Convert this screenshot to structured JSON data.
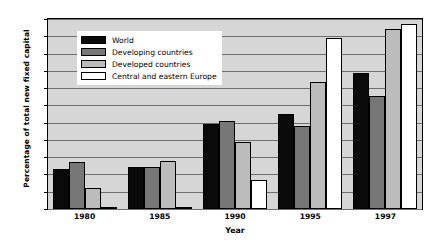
{
  "chart_data": {
    "type": "bar",
    "title": "",
    "xlabel": "Year",
    "ylabel": "Percentage of total new fixed capital",
    "categories": [
      "1980",
      "1985",
      "1990",
      "1995",
      "1997"
    ],
    "ylim": [
      0,
      11
    ],
    "yticks": [
      0,
      1,
      2,
      3,
      4,
      5,
      6,
      7,
      8,
      9,
      10,
      11
    ],
    "grid": true,
    "legend_position": "top-left-inside",
    "series": [
      {
        "name": "World",
        "color": "#0a0a0a",
        "values": [
          2.3,
          2.45,
          4.9,
          5.5,
          7.85
        ]
      },
      {
        "name": "Developing countries",
        "color": "#777777",
        "values": [
          2.75,
          2.45,
          5.1,
          4.8,
          6.55
        ]
      },
      {
        "name": "Developed countries",
        "color": "#bcbcbc",
        "values": [
          1.2,
          2.8,
          3.9,
          7.35,
          10.4
        ]
      },
      {
        "name": "Central and eastern Europe",
        "color": "#ffffff",
        "values": [
          0.1,
          0.1,
          1.7,
          9.9,
          10.7
        ]
      }
    ]
  }
}
